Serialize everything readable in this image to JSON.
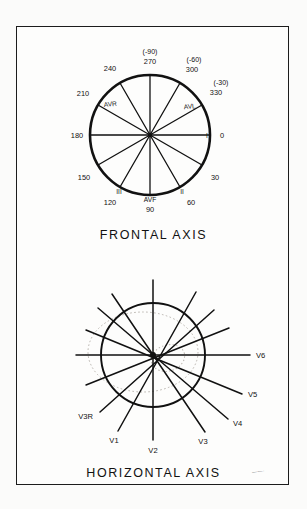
{
  "figure": {
    "frontal": {
      "caption": "FRONTAL AXIS",
      "degree_labels": [
        {
          "text": "270",
          "deg": 270
        },
        {
          "text": "300",
          "deg": 300
        },
        {
          "text": "330",
          "deg": 330
        },
        {
          "text": "0",
          "deg": 0
        },
        {
          "text": "30",
          "deg": 30
        },
        {
          "text": "60",
          "deg": 60
        },
        {
          "text": "90",
          "deg": 90
        },
        {
          "text": "120",
          "deg": 120
        },
        {
          "text": "150",
          "deg": 150
        },
        {
          "text": "180",
          "deg": 180
        },
        {
          "text": "210",
          "deg": 210
        },
        {
          "text": "240",
          "deg": 240
        }
      ],
      "negative_labels": [
        {
          "text": "(-90)",
          "deg": 270
        },
        {
          "text": "(-60)",
          "deg": 300
        },
        {
          "text": "(-30)",
          "deg": 330
        }
      ],
      "lead_labels": [
        {
          "text": "AVR",
          "deg": 210
        },
        {
          "text": "AVL",
          "deg": 330
        },
        {
          "text": "AVF",
          "deg": 90
        },
        {
          "text": "I",
          "deg": 0
        },
        {
          "text": "II",
          "deg": 60
        },
        {
          "text": "III",
          "deg": 120
        }
      ]
    },
    "horizontal": {
      "caption": "HORIZONTAL AXIS",
      "lead_labels": [
        {
          "text": "V6"
        },
        {
          "text": "V5"
        },
        {
          "text": "V4"
        },
        {
          "text": "V3"
        },
        {
          "text": "V2"
        },
        {
          "text": "V1"
        },
        {
          "text": "V3R"
        }
      ]
    },
    "signature": "hand-signature"
  },
  "colors": {
    "ink": "#111111",
    "frame": "#1c1c1c",
    "faint": "#b9b4ae",
    "paper": "#fdfdfc"
  }
}
